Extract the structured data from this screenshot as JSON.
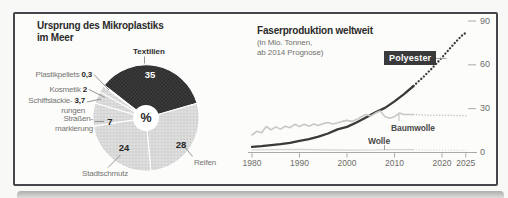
{
  "pie": {
    "title_line1": "Ursprung des Mikroplastiks",
    "title_line2": "im Meer",
    "center_symbol": "%",
    "labels": {
      "textilien": "Textilien",
      "textilien_value": "35",
      "reifen": "Reifen",
      "reifen_value": "28",
      "stadtschmutz": "Stadtschmutz",
      "stadtschmutz_value": "24",
      "strassenmarkierung_line1": "Straßen-",
      "strassenmarkierung_line2": "markierung",
      "strassenmarkierung_value": "7",
      "schiffslackierungen_line1": "Schiffslackie-",
      "schiffslackierungen_line2": "rungen",
      "schiffslackierungen_value": "3,7",
      "kosmetik": "Kosmetik",
      "kosmetik_value": "2",
      "plastikpellets": "Plastikpellets",
      "plastikpellets_value": "0,3"
    }
  },
  "line": {
    "title": "Faserproduktion weltweit",
    "subtitle_line1": "(in Mio. Tonnen,",
    "subtitle_line2": "ab 2014 Prognose)",
    "series_labels": {
      "polyester": "Polyester",
      "baumwolle": "Baumwolle",
      "wolle": "Wolle"
    },
    "x_ticks": [
      "1980",
      "1990",
      "2000",
      "2010",
      "2020",
      "2025"
    ],
    "y_ticks": [
      "0",
      "30",
      "60",
      "90"
    ]
  },
  "colors": {
    "dark_slice": "#3d3d3d",
    "light_slice": "#dcdcda",
    "polyester_line": "#3a3a3a",
    "baumwolle_line": "#c7c7c5",
    "wolle_line": "#d3d3d1"
  },
  "chart_data": [
    {
      "type": "pie",
      "title": "Ursprung des Mikroplastiks im Meer",
      "unit": "%",
      "labels": [
        "Textilien",
        "Reifen",
        "Stadtschmutz",
        "Straßenmarkierung",
        "Schiffslackierungen",
        "Kosmetik",
        "Plastikpellets"
      ],
      "values": [
        35,
        28,
        24,
        7,
        3.7,
        2,
        0.3
      ],
      "start_angle_deg": -52,
      "direction": "clockwise"
    },
    {
      "type": "line",
      "title": "Faserproduktion weltweit",
      "subtitle": "in Mio. Tonnen, ab 2014 Prognose",
      "xlim": [
        1978,
        2026
      ],
      "ylim": [
        0,
        90
      ],
      "y_tick_values": [
        0,
        30,
        60,
        90
      ],
      "x_tick_values": [
        1980,
        1990,
        2000,
        2010,
        2020,
        2025
      ],
      "forecast_from": 2014,
      "series": [
        {
          "name": "Polyester",
          "points": [
            [
              1980,
              3.8
            ],
            [
              1982,
              4.3
            ],
            [
              1984,
              5
            ],
            [
              1986,
              5.7
            ],
            [
              1988,
              6.6
            ],
            [
              1990,
              8
            ],
            [
              1992,
              9.2
            ],
            [
              1994,
              10.8
            ],
            [
              1996,
              13
            ],
            [
              1998,
              15.8
            ],
            [
              2000,
              17.5
            ],
            [
              2002,
              20.5
            ],
            [
              2004,
              24
            ],
            [
              2006,
              27.5
            ],
            [
              2008,
              30.5
            ],
            [
              2010,
              35
            ],
            [
              2012,
              40
            ],
            [
              2014,
              45.5
            ],
            [
              2016,
              51.5
            ],
            [
              2018,
              58
            ],
            [
              2020,
              65
            ],
            [
              2022,
              72.5
            ],
            [
              2024,
              79.5
            ],
            [
              2025,
              82
            ]
          ]
        },
        {
          "name": "Baumwolle",
          "points": [
            [
              1980,
              12
            ],
            [
              1981,
              14.5
            ],
            [
              1982,
              13.5
            ],
            [
              1983,
              17.8
            ],
            [
              1984,
              15.5
            ],
            [
              1985,
              17.5
            ],
            [
              1986,
              16
            ],
            [
              1987,
              18
            ],
            [
              1988,
              17
            ],
            [
              1989,
              19.3
            ],
            [
              1990,
              17.8
            ],
            [
              1991,
              19.3
            ],
            [
              1992,
              18
            ],
            [
              1993,
              19.5
            ],
            [
              1994,
              18.5
            ],
            [
              1995,
              19.8
            ],
            [
              1996,
              20.5
            ],
            [
              1997,
              19.5
            ],
            [
              1998,
              20.3
            ],
            [
              1999,
              21.3
            ],
            [
              2000,
              22
            ],
            [
              2001,
              21.3
            ],
            [
              2002,
              22.5
            ],
            [
              2003,
              24.5
            ],
            [
              2004,
              26
            ],
            [
              2005,
              25
            ],
            [
              2006,
              27
            ],
            [
              2007,
              28.5
            ],
            [
              2008,
              24.5
            ],
            [
              2009,
              23.5
            ],
            [
              2010,
              24.5
            ],
            [
              2011,
              27
            ],
            [
              2012,
              26
            ],
            [
              2014,
              26
            ],
            [
              2017,
              25.5
            ],
            [
              2020,
              25.5
            ],
            [
              2025,
              25.2
            ]
          ]
        },
        {
          "name": "Wolle",
          "points": [
            [
              1980,
              1.7
            ],
            [
              1985,
              1.9
            ],
            [
              1990,
              2.1
            ],
            [
              1995,
              1.8
            ],
            [
              2000,
              1.6
            ],
            [
              2005,
              1.7
            ],
            [
              2010,
              1.9
            ],
            [
              2014,
              1.9
            ],
            [
              2019,
              1.7
            ],
            [
              2025,
              1.5
            ]
          ]
        }
      ]
    }
  ]
}
